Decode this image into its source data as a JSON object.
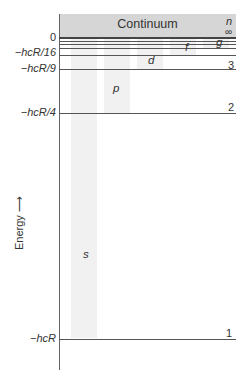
{
  "diagram": {
    "type": "energy-level-diagram",
    "continuum_label": "Continuum",
    "n_header": "n",
    "n_infinity": "∞",
    "axis_label": "Energy",
    "axis_arrow": "⟶",
    "energy_ticks": [
      {
        "label": "0",
        "y": 38
      },
      {
        "label": "−hcR/16",
        "y": 53
      },
      {
        "label": "−hcR/9",
        "y": 69
      },
      {
        "label": "−hcR/4",
        "y": 113
      },
      {
        "label": "−hcR",
        "y": 339
      }
    ],
    "levels": [
      {
        "n": "1",
        "y": 339
      },
      {
        "n": "2",
        "y": 113
      },
      {
        "n": "3",
        "y": 69
      },
      {
        "n": "4",
        "y": 55
      },
      {
        "n": "5",
        "y": 48
      },
      {
        "n": "6",
        "y": 44
      },
      {
        "n": "∞",
        "y": 38
      }
    ],
    "subshells": [
      {
        "label": "s",
        "x": 83,
        "y": 250
      },
      {
        "label": "p",
        "x": 113,
        "y": 84
      },
      {
        "label": "d",
        "x": 148,
        "y": 55
      },
      {
        "label": "f",
        "x": 186,
        "y": 41
      },
      {
        "label": "g",
        "x": 217,
        "y": 38
      }
    ],
    "colors": {
      "continuum": "#d6d6d6",
      "column_shade": "#f1f1f1",
      "lines": "#555555"
    }
  }
}
